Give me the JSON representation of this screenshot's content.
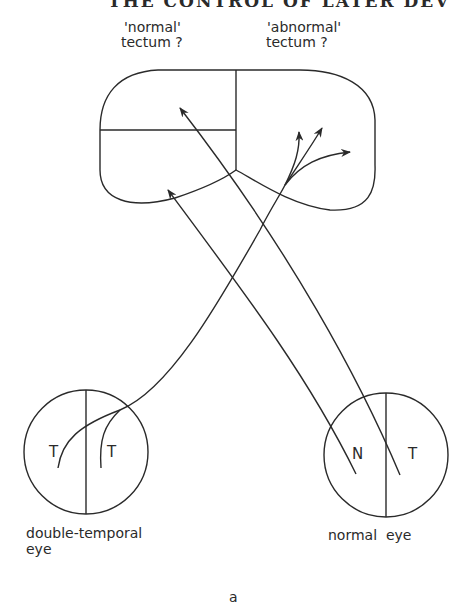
{
  "header": {
    "running_title": "THE CONTROL OF LATER DEV"
  },
  "tectum": {
    "left_label_line1": "'normal'",
    "left_label_line2": "tectum ?",
    "right_label_line1": "'abnormal'",
    "right_label_line2": "tectum ?"
  },
  "eyes": {
    "left": {
      "half_left": "T",
      "half_right": "T",
      "label_line1": "double-temporal",
      "label_line2": "eye"
    },
    "right": {
      "half_left": "N",
      "half_right": "T",
      "label": "normal  eye"
    }
  },
  "panel_label": "a",
  "colors": {
    "line": "#2a2a2a",
    "background": "#ffffff"
  }
}
